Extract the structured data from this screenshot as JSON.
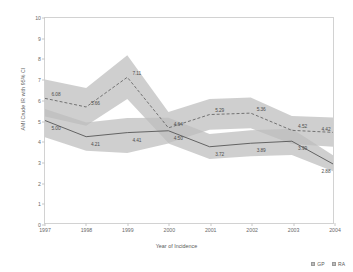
{
  "chart_data": {
    "type": "line",
    "title": "",
    "xlabel": "Year of Incidence",
    "ylabel": "AMI Crude IR with 95% CI",
    "categories": [
      "1997",
      "1998",
      "1999",
      "2000",
      "2001",
      "2002",
      "2003",
      "2004"
    ],
    "x": [
      1997,
      1998,
      1999,
      2000,
      2001,
      2002,
      2003,
      2004
    ],
    "xlim": [
      1997,
      2004
    ],
    "ylim": [
      0,
      10
    ],
    "yticks": [
      0,
      1,
      2,
      3,
      4,
      5,
      6,
      7,
      8,
      9,
      10
    ],
    "grid": false,
    "legend_position": "bottom-right",
    "series": [
      {
        "name": "GP",
        "style": "dashed",
        "values": [
          6.08,
          5.66,
          7.11,
          4.64,
          5.29,
          5.36,
          4.52,
          4.42
        ],
        "labels": [
          "6.08",
          "5.66",
          "7.11",
          "4.64",
          "5.29",
          "5.36",
          "4.52",
          "4.42"
        ],
        "ci_lower": [
          5.2,
          4.75,
          6.05,
          3.9,
          4.55,
          4.62,
          3.85,
          3.72
        ],
        "ci_upper": [
          7.0,
          6.58,
          8.18,
          5.42,
          6.05,
          6.12,
          5.22,
          5.15
        ],
        "color": "#666666",
        "band_color": "#bdbdbd"
      },
      {
        "name": "RA",
        "style": "solid",
        "values": [
          5.0,
          4.21,
          4.41,
          4.5,
          3.72,
          3.89,
          3.99,
          2.88
        ],
        "labels": [
          "5.00",
          "4.21",
          "4.41",
          "4.50",
          "3.72",
          "3.89",
          "3.99",
          "2.88"
        ],
        "ci_lower": [
          4.18,
          3.52,
          3.42,
          3.88,
          3.12,
          3.26,
          3.32,
          2.52
        ],
        "ci_upper": [
          5.56,
          4.9,
          5.12,
          5.14,
          4.34,
          4.52,
          4.6,
          3.3
        ],
        "color": "#555555",
        "band_color": "#bdbdbd"
      }
    ],
    "legend": [
      {
        "label": "GP",
        "color": "#bdbdbd"
      },
      {
        "label": "RA",
        "color": "#bdbdbd"
      }
    ]
  }
}
